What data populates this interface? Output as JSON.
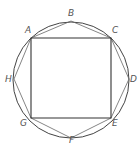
{
  "diagram": {
    "type": "inscribed-polygons",
    "colors": {
      "stroke": "#444444",
      "label": "#555555",
      "background": "#ffffff"
    },
    "circle": {
      "cx": 71,
      "cy": 80,
      "r": 58
    },
    "points": [
      {
        "name": "A",
        "x": 31,
        "y": 38,
        "lx": 25,
        "ly": 33
      },
      {
        "name": "B",
        "x": 71,
        "y": 21,
        "lx": 68,
        "ly": 16
      },
      {
        "name": "C",
        "x": 111,
        "y": 38,
        "lx": 112,
        "ly": 33
      },
      {
        "name": "D",
        "x": 129,
        "y": 79,
        "lx": 130,
        "ly": 82
      },
      {
        "name": "E",
        "x": 111,
        "y": 118,
        "lx": 112,
        "ly": 126
      },
      {
        "name": "F",
        "x": 71,
        "y": 138,
        "lx": 69,
        "ly": 142
      },
      {
        "name": "G",
        "x": 31,
        "y": 118,
        "lx": 20,
        "ly": 126
      },
      {
        "name": "H",
        "x": 14,
        "y": 79,
        "lx": 6,
        "ly": 82
      }
    ],
    "labels": {
      "A": "A",
      "B": "B",
      "C": "C",
      "D": "D",
      "E": "E",
      "F": "F",
      "G": "G",
      "H": "H"
    }
  }
}
